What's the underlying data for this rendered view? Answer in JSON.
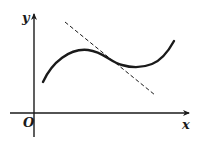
{
  "diagram": {
    "axes": {
      "y_label": "y",
      "x_label": "x",
      "origin_label": "O"
    },
    "curve": {
      "description": "cubic-like function curve with local max and local min"
    },
    "tangent_line": {
      "style": "dashed",
      "description": "tangent line touching curve near inflection point"
    },
    "colors": {
      "ink": "#1a1a1a",
      "background": "#ffffff"
    }
  }
}
